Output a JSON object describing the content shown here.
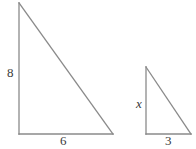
{
  "figure": {
    "type": "similar-right-triangles-diagram",
    "background_color": "#ffffff",
    "stroke_color": "#8a8a8a",
    "stroke_width": 1.3,
    "label_color": "#3a3a3a",
    "shapes": [
      {
        "name": "large-triangle",
        "kind": "right-triangle",
        "right_angle_at": "bottom-left",
        "vertices": {
          "apex": [
            19,
            3
          ],
          "bottom_left": [
            19,
            134
          ],
          "bottom_right": [
            113,
            134
          ]
        },
        "labels": {
          "vertical_leg": "8",
          "base_leg": "6"
        }
      },
      {
        "name": "small-triangle",
        "kind": "right-triangle",
        "right_angle_at": "bottom-left",
        "vertices": {
          "apex": [
            146,
            67
          ],
          "bottom_left": [
            146,
            134
          ],
          "bottom_right": [
            191,
            134
          ]
        },
        "labels": {
          "vertical_leg": "x",
          "base_leg": "3"
        }
      }
    ]
  },
  "labels": {
    "large_vertical": "8",
    "large_base": "6",
    "small_vertical": "x",
    "small_base": "3"
  }
}
